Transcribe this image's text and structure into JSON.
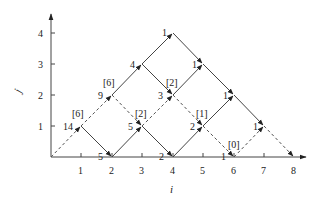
{
  "diagram": {
    "axes": {
      "x_label": "i",
      "y_label": "j",
      "x_ticks": [
        "1",
        "2",
        "3",
        "4",
        "5",
        "6",
        "7",
        "8"
      ],
      "y_ticks": [
        "1",
        "2",
        "3",
        "4"
      ]
    },
    "solid_edges": [
      {
        "from": [
          2,
          2
        ],
        "to": [
          4,
          4
        ]
      },
      {
        "from": [
          4,
          4
        ],
        "to": [
          7,
          1
        ]
      },
      {
        "from": [
          1,
          1
        ],
        "to": [
          2,
          0
        ]
      },
      {
        "from": [
          2,
          0
        ],
        "to": [
          3,
          1
        ]
      },
      {
        "from": [
          3,
          1
        ],
        "to": [
          4,
          0
        ]
      },
      {
        "from": [
          3,
          3
        ],
        "to": [
          4,
          2
        ]
      },
      {
        "from": [
          4,
          2
        ],
        "to": [
          5,
          3
        ]
      },
      {
        "from": [
          4,
          0
        ],
        "to": [
          6,
          2
        ]
      }
    ],
    "dashed_edges": [
      {
        "from": [
          0,
          0
        ],
        "to": [
          2,
          2
        ]
      },
      {
        "from": [
          2,
          2
        ],
        "to": [
          3,
          1
        ]
      },
      {
        "from": [
          3,
          1
        ],
        "to": [
          4,
          2
        ]
      },
      {
        "from": [
          4,
          2
        ],
        "to": [
          6,
          0
        ]
      },
      {
        "from": [
          6,
          0
        ],
        "to": [
          7,
          1
        ]
      },
      {
        "from": [
          7,
          1
        ],
        "to": [
          8,
          0
        ]
      }
    ],
    "node_labels": [
      {
        "pos": [
          1,
          1
        ],
        "value": "14",
        "bracket": "[6]"
      },
      {
        "pos": [
          2,
          2
        ],
        "value": "9",
        "bracket": "[6]"
      },
      {
        "pos": [
          3,
          3
        ],
        "value": "4"
      },
      {
        "pos": [
          4,
          4
        ],
        "value": "1"
      },
      {
        "pos": [
          2,
          0
        ],
        "value": "5"
      },
      {
        "pos": [
          3,
          1
        ],
        "value": "5",
        "bracket": "[2]"
      },
      {
        "pos": [
          4,
          2
        ],
        "value": "3",
        "bracket": "[2]"
      },
      {
        "pos": [
          5,
          3
        ],
        "value": "1"
      },
      {
        "pos": [
          4,
          0
        ],
        "value": "2"
      },
      {
        "pos": [
          5,
          1
        ],
        "value": "2",
        "bracket": "[1]"
      },
      {
        "pos": [
          6,
          2
        ],
        "value": "1"
      },
      {
        "pos": [
          6,
          0
        ],
        "value": "1",
        "bracket": "[0]"
      },
      {
        "pos": [
          7,
          1
        ],
        "value": "1"
      }
    ],
    "labels": {
      "n11": "14",
      "b11": "[6]",
      "n22": "9",
      "b22": "[6]",
      "n33": "4",
      "n44": "1",
      "n20": "5",
      "n31": "5",
      "b31": "[2]",
      "n42": "3",
      "b42": "[2]",
      "n53": "1",
      "n40": "2",
      "n51": "2",
      "b51": "[1]",
      "n62": "1",
      "n60": "1",
      "b60": "[0]",
      "n71": "1"
    }
  }
}
